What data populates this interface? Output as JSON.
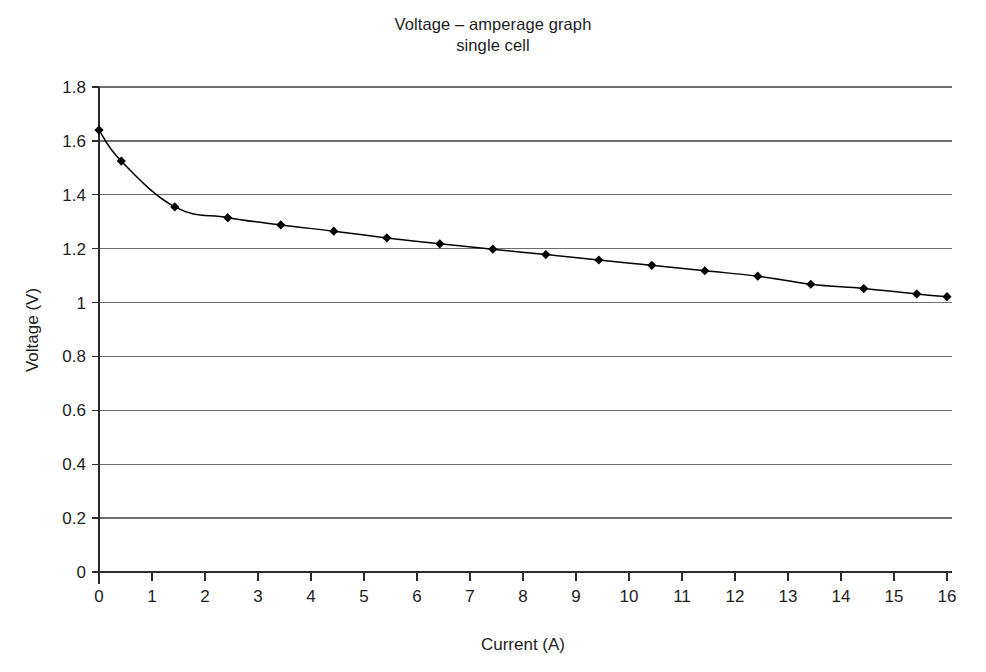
{
  "chart_data": {
    "type": "line",
    "title": "Voltage – amperage graph",
    "subtitle": "single cell",
    "xlabel": "Current (A)",
    "ylabel": "Voltage (V)",
    "xlim": [
      0,
      16
    ],
    "ylim": [
      0,
      1.8
    ],
    "xticks": [
      "0",
      "1",
      "2",
      "3",
      "4",
      "5",
      "6",
      "7",
      "8",
      "9",
      "10",
      "11",
      "12",
      "13",
      "14",
      "15",
      "16"
    ],
    "yticks": [
      "0",
      "0.2",
      "0.4",
      "0.6",
      "0.8",
      "1",
      "1.2",
      "1.4",
      "1.6",
      "1.8"
    ],
    "grid": "horizontal",
    "legend": "none",
    "marker": "diamond",
    "series": [
      {
        "name": "single cell",
        "color": "#000000",
        "points": [
          {
            "x": 0.0,
            "y": 1.64
          },
          {
            "x": 0.42,
            "y": 1.525
          },
          {
            "x": 1.43,
            "y": 1.355
          },
          {
            "x": 2.43,
            "y": 1.315
          },
          {
            "x": 3.43,
            "y": 1.288
          },
          {
            "x": 4.43,
            "y": 1.265
          },
          {
            "x": 5.43,
            "y": 1.24
          },
          {
            "x": 6.43,
            "y": 1.218
          },
          {
            "x": 7.43,
            "y": 1.198
          },
          {
            "x": 8.43,
            "y": 1.178
          },
          {
            "x": 9.43,
            "y": 1.158
          },
          {
            "x": 10.43,
            "y": 1.138
          },
          {
            "x": 11.43,
            "y": 1.118
          },
          {
            "x": 12.43,
            "y": 1.098
          },
          {
            "x": 13.43,
            "y": 1.068
          },
          {
            "x": 14.43,
            "y": 1.052
          },
          {
            "x": 15.43,
            "y": 1.032
          },
          {
            "x": 16.0,
            "y": 1.022
          }
        ]
      }
    ]
  },
  "style": {
    "axis_color": "#2b2b2b",
    "grid_color": "#6e6e6e",
    "line_color": "#1a1a1a",
    "marker_color": "#000000",
    "background": "#ffffff"
  }
}
